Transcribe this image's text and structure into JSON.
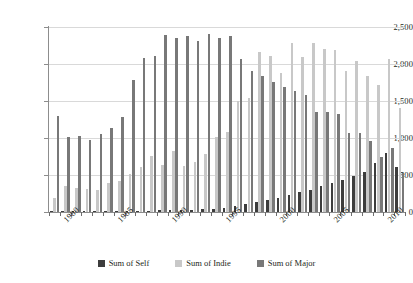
{
  "chart_data": {
    "type": "bar",
    "title": "",
    "subtitle": "",
    "xlabel": "",
    "ylabel": "",
    "ylim": [
      0,
      2500
    ],
    "yticks": [
      0,
      500,
      1000,
      1500,
      2000,
      2500
    ],
    "ytick_labels": [
      "0",
      "500",
      "1,000",
      "1,500",
      "2,000",
      "2,500"
    ],
    "grid": true,
    "legend_position": "bottom",
    "x_tick_labels": [
      "1980",
      "1985",
      "1990",
      "1995",
      "2000",
      "2005",
      "2010"
    ],
    "categories": [
      "1979",
      "1980",
      "1981",
      "1982",
      "1983",
      "1984",
      "1985",
      "1986",
      "1987",
      "1988",
      "1989",
      "1990",
      "1991",
      "1992",
      "1993",
      "1994",
      "1995",
      "1996",
      "1997",
      "1998",
      "1999",
      "2000",
      "2001",
      "2002",
      "2003",
      "2004",
      "2005",
      "2006",
      "2007",
      "2008",
      "2009",
      "2010",
      "2011"
    ],
    "series": [
      {
        "name": "Sum of Self",
        "color": "#3d3d3d",
        "values": [
          5,
          10,
          12,
          10,
          12,
          12,
          14,
          16,
          18,
          20,
          22,
          25,
          28,
          30,
          35,
          40,
          55,
          80,
          110,
          135,
          165,
          195,
          230,
          270,
          300,
          345,
          390,
          430,
          480,
          540,
          660,
          800,
          610
        ]
      },
      {
        "name": "Sum of Indie",
        "color": "#c8c8c8",
        "values": [
          190,
          345,
          330,
          310,
          300,
          390,
          425,
          515,
          610,
          755,
          635,
          830,
          625,
          680,
          780,
          1020,
          1080,
          1500,
          1540,
          2160,
          2110,
          1880,
          2290,
          2100,
          2290,
          2200,
          2185,
          1900,
          2045,
          1840,
          1715,
          2070,
          1410
        ]
      },
      {
        "name": "Sum of Major",
        "color": "#787878",
        "values": [
          1300,
          1015,
          1025,
          975,
          1050,
          1140,
          1280,
          1780,
          2075,
          2110,
          2390,
          2345,
          2385,
          2315,
          2410,
          2345,
          2385,
          2065,
          1905,
          1840,
          1760,
          1690,
          1640,
          1580,
          1350,
          1345,
          1330,
          1070,
          1070,
          960,
          740,
          870,
          530
        ]
      }
    ]
  },
  "legend": {
    "items": [
      {
        "label": "Sum of Self",
        "key": "self"
      },
      {
        "label": "Sum of Indie",
        "key": "indie"
      },
      {
        "label": "Sum of Major",
        "key": "major"
      }
    ]
  }
}
